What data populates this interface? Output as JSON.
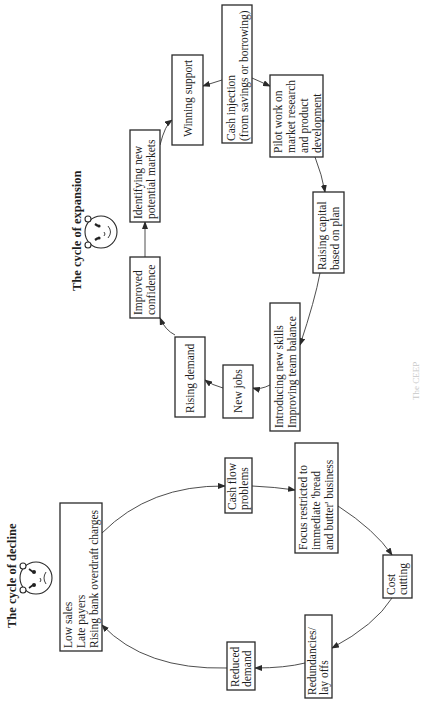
{
  "figure": {
    "orientation": "rotated 90 degrees counter-clockwise",
    "caption_visible_fragment": "The CEEP"
  },
  "expansion_cycle": {
    "title": "The cycle of expansion",
    "face": "smiling-face",
    "nodes": [
      {
        "id": "improved-confidence",
        "lines": [
          "Improved",
          "confidence"
        ]
      },
      {
        "id": "identifying-markets",
        "lines": [
          "Identifying new",
          "potential markets"
        ]
      },
      {
        "id": "winning-support",
        "lines": [
          "Winning support"
        ]
      },
      {
        "id": "cash-injection",
        "lines": [
          "Cash injection",
          "(from savings or borrowing)"
        ]
      },
      {
        "id": "pilot-work",
        "lines": [
          "Pilot work on",
          "market research",
          "and product",
          "development"
        ]
      },
      {
        "id": "raising-capital",
        "lines": [
          "Raising capital",
          "based on plan"
        ]
      },
      {
        "id": "introducing-skills",
        "lines": [
          "Introducing new skills",
          "Improving team balance"
        ]
      },
      {
        "id": "new-jobs",
        "lines": [
          "New jobs"
        ]
      },
      {
        "id": "rising-demand",
        "lines": [
          "Rising demand"
        ]
      }
    ],
    "flow": [
      "improved-confidence",
      "identifying-markets",
      "winning-support",
      "cash-injection",
      "pilot-work",
      "raising-capital",
      "introducing-skills",
      "new-jobs",
      "rising-demand",
      "improved-confidence"
    ]
  },
  "decline_cycle": {
    "title": "The cycle of decline",
    "face": "frowning-face",
    "nodes": [
      {
        "id": "low-sales",
        "lines": [
          "Low sales",
          "Late payers",
          "Rising bank overdraft charges"
        ]
      },
      {
        "id": "cash-flow",
        "lines": [
          "Cash flow",
          "problems"
        ]
      },
      {
        "id": "focus-restricted",
        "lines": [
          "Focus restricted to",
          "immediate 'bread",
          "and butter' business"
        ]
      },
      {
        "id": "cost-cutting",
        "lines": [
          "Cost",
          "cutting"
        ]
      },
      {
        "id": "redundancies",
        "lines": [
          "Redundancies/",
          "lay offs"
        ]
      },
      {
        "id": "reduced-demand",
        "lines": [
          "Reduced",
          "demand"
        ]
      }
    ],
    "flow": [
      "low-sales",
      "cash-flow",
      "focus-restricted",
      "cost-cutting",
      "redundancies",
      "reduced-demand",
      "low-sales"
    ]
  }
}
